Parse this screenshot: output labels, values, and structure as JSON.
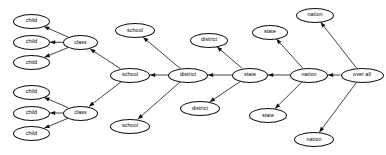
{
  "diagram": {
    "type": "directed-tree",
    "orientation": "right-to-left",
    "background_color": "#ffffff",
    "node_fill": "#ffffff",
    "node_stroke": "#111111",
    "edge_color": "#111111",
    "nodes": [
      {
        "id": "child1",
        "label": "child",
        "cx": 31.5,
        "cy": 21,
        "rx": 18.5,
        "ry": 7.5
      },
      {
        "id": "child2",
        "label": "child",
        "cx": 31.5,
        "cy": 42,
        "rx": 18.5,
        "ry": 7.5
      },
      {
        "id": "child3",
        "label": "child",
        "cx": 31.5,
        "cy": 62.5,
        "rx": 18.5,
        "ry": 7.5
      },
      {
        "id": "child4",
        "label": "child",
        "cx": 31.5,
        "cy": 92,
        "rx": 18.5,
        "ry": 7.5
      },
      {
        "id": "child5",
        "label": "child",
        "cx": 31.5,
        "cy": 113,
        "rx": 18.5,
        "ry": 7.5
      },
      {
        "id": "child6",
        "label": "child",
        "cx": 31.5,
        "cy": 133.5,
        "rx": 18.5,
        "ry": 7.5
      },
      {
        "id": "class1",
        "label": "class",
        "cx": 80.5,
        "cy": 42.5,
        "rx": 17.5,
        "ry": 7.5
      },
      {
        "id": "class2",
        "label": "class",
        "cx": 80.5,
        "cy": 113,
        "rx": 17.5,
        "ry": 7.5
      },
      {
        "id": "school_top",
        "label": "school",
        "cx": 135,
        "cy": 30.5,
        "rx": 20,
        "ry": 7.5
      },
      {
        "id": "school_mid",
        "label": "school",
        "cx": 130,
        "cy": 75,
        "rx": 20,
        "ry": 7.5
      },
      {
        "id": "school_bot",
        "label": "school",
        "cx": 130,
        "cy": 126,
        "rx": 20,
        "ry": 7.5
      },
      {
        "id": "district_top",
        "label": "district",
        "cx": 209,
        "cy": 40,
        "rx": 19,
        "ry": 7.5
      },
      {
        "id": "district_mid",
        "label": "district",
        "cx": 188,
        "cy": 75,
        "rx": 20,
        "ry": 7.5
      },
      {
        "id": "district_bot",
        "label": "district",
        "cx": 200,
        "cy": 108.5,
        "rx": 20,
        "ry": 7.5
      },
      {
        "id": "state_top",
        "label": "state",
        "cx": 270,
        "cy": 32,
        "rx": 18,
        "ry": 7.5
      },
      {
        "id": "state_mid",
        "label": "state",
        "cx": 250,
        "cy": 75,
        "rx": 18,
        "ry": 7.5
      },
      {
        "id": "state_bot",
        "label": "state",
        "cx": 268,
        "cy": 115.5,
        "rx": 19,
        "ry": 7.5
      },
      {
        "id": "nation_top",
        "label": "nation",
        "cx": 315,
        "cy": 15,
        "rx": 19,
        "ry": 7.5
      },
      {
        "id": "nation_mid",
        "label": "nation",
        "cx": 309,
        "cy": 75,
        "rx": 19,
        "ry": 7.5
      },
      {
        "id": "nation_bot",
        "label": "nation",
        "cx": 314,
        "cy": 139.5,
        "rx": 20,
        "ry": 7.5
      },
      {
        "id": "overall",
        "label": "over all",
        "cx": 362,
        "cy": 75,
        "rx": 21.5,
        "ry": 7.5
      }
    ],
    "edges": [
      {
        "id": "e1",
        "from": "class1",
        "to": "child1"
      },
      {
        "id": "e2",
        "from": "class1",
        "to": "child2"
      },
      {
        "id": "e3",
        "from": "class1",
        "to": "child3"
      },
      {
        "id": "e4",
        "from": "class2",
        "to": "child4"
      },
      {
        "id": "e5",
        "from": "class2",
        "to": "child5"
      },
      {
        "id": "e6",
        "from": "class2",
        "to": "child6"
      },
      {
        "id": "e7",
        "from": "school_mid",
        "to": "class1"
      },
      {
        "id": "e8",
        "from": "school_mid",
        "to": "class2"
      },
      {
        "id": "e9",
        "from": "district_mid",
        "to": "school_top"
      },
      {
        "id": "e10",
        "from": "district_mid",
        "to": "school_mid"
      },
      {
        "id": "e11",
        "from": "district_mid",
        "to": "school_bot"
      },
      {
        "id": "e12",
        "from": "state_mid",
        "to": "district_top"
      },
      {
        "id": "e13",
        "from": "state_mid",
        "to": "district_mid"
      },
      {
        "id": "e14",
        "from": "state_mid",
        "to": "district_bot"
      },
      {
        "id": "e15",
        "from": "nation_mid",
        "to": "state_top"
      },
      {
        "id": "e16",
        "from": "nation_mid",
        "to": "state_mid"
      },
      {
        "id": "e17",
        "from": "nation_mid",
        "to": "state_bot"
      },
      {
        "id": "e18",
        "from": "overall",
        "to": "nation_top"
      },
      {
        "id": "e19",
        "from": "overall",
        "to": "nation_mid"
      },
      {
        "id": "e20",
        "from": "overall",
        "to": "nation_bot"
      }
    ]
  }
}
